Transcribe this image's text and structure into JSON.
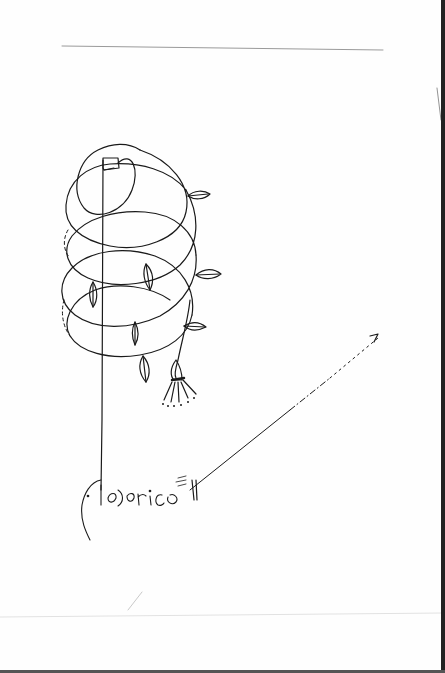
{
  "artwork": {
    "subject": "line drawing of a spiraling vine with leaves and a bell-shaped flower, arrow pointing up-right",
    "signature": "federico",
    "colors": {
      "paper": "#fefefe",
      "ink": "#1a1a1a",
      "rule": "#9a9a9a",
      "edge": "#222222"
    },
    "elements": {
      "top_rule": "horizontal rule",
      "spiral_vine": "looping spiral vine",
      "stem": "vertical stem",
      "leaves_count": 7,
      "flower": "bell flower with dotted stamens",
      "arrow": "dashed arrow pointing up-right"
    }
  }
}
